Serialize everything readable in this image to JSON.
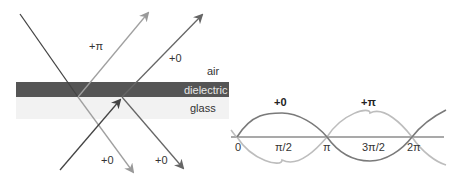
{
  "thin_film": {
    "labels": {
      "reflected_top_phase": "+π",
      "reflected_bottom_phase": "+0",
      "air": "air",
      "dielectric": "dielectric",
      "glass": "glass",
      "transmitted_left_phase": "+0",
      "transmitted_right_phase": "+0"
    },
    "colors": {
      "dielectric_band": "#555555",
      "glass_band": "#f0f0f0",
      "dark_ray": "#555555",
      "light_ray": "#9a9a9a",
      "incident_ray": "#333333"
    }
  },
  "wave_plot": {
    "curve_labels": {
      "dark_wave": "+0",
      "light_wave": "+π"
    },
    "ticks": [
      "0",
      "π/2",
      "π",
      "3π/2",
      "2π"
    ],
    "colors": {
      "dark_wave": "#777777",
      "light_wave": "#bbbbbb",
      "axis": "#555555"
    }
  }
}
